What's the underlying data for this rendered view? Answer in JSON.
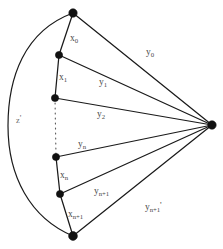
{
  "figure": {
    "name": "graph-diagram",
    "background_color": "#ffffff",
    "stroke_color": "#1a1a1a",
    "label_color": "#4a4a4a",
    "width": 223,
    "height": 249
  },
  "vertices": [
    {
      "id": "top",
      "name": "vertex-top",
      "cx": 73,
      "cy": 13,
      "r": 4.2
    },
    {
      "id": "v1",
      "name": "vertex-1",
      "cx": 59,
      "cy": 55,
      "r": 3.6
    },
    {
      "id": "v2",
      "name": "vertex-2",
      "cx": 55,
      "cy": 98,
      "r": 3.6
    },
    {
      "id": "v3",
      "name": "vertex-3",
      "cx": 56,
      "cy": 157,
      "r": 3.6
    },
    {
      "id": "v4",
      "name": "vertex-4",
      "cx": 60,
      "cy": 194,
      "r": 3.6
    },
    {
      "id": "bottom",
      "name": "vertex-bottom",
      "cx": 73,
      "cy": 236,
      "r": 4.4
    },
    {
      "id": "apex",
      "name": "vertex-apex-right",
      "cx": 212,
      "cy": 125,
      "r": 4.2
    }
  ],
  "chain_edges": [
    {
      "name": "chain-edge-x0",
      "label_key": "x0",
      "d": "M 73 13 L 59 55"
    },
    {
      "name": "chain-edge-x1",
      "label_key": "x1",
      "d": "M 59 55 L 55 98"
    },
    {
      "name": "chain-edge-xn",
      "label_key": "xn",
      "d": "M 56 157 L 60 194"
    },
    {
      "name": "chain-edge-xnp1",
      "label_key": "xnp1",
      "d": "M 60 194 L 73 236"
    }
  ],
  "chain_gap": {
    "name": "chain-ellipsis-dashed",
    "d": "M 55 98 L 56 157"
  },
  "spoke_edges": [
    {
      "name": "spoke-edge-y0",
      "label_key": "y0",
      "d": "M 73 13 L 212 125"
    },
    {
      "name": "spoke-edge-y1",
      "label_key": "y1",
      "d": "M 59 55 L 212 125"
    },
    {
      "name": "spoke-edge-y2",
      "label_key": "y2",
      "d": "M 55 98 L 212 125"
    },
    {
      "name": "spoke-edge-yn",
      "label_key": "yn",
      "d": "M 56 157 L 212 125"
    },
    {
      "name": "spoke-edge-ynp1",
      "label_key": "ynp1",
      "d": "M 60 194 L 212 125"
    },
    {
      "name": "spoke-edge-ynp1p",
      "label_key": "ynp1p",
      "d": "M 73 236 L 212 125"
    }
  ],
  "outer_arc": {
    "name": "outer-arc-z-prime",
    "d": "M 73 13 C 24 31, 8 78, 8 126 C 8 176, 30 218, 73 236"
  },
  "labels": {
    "x0": {
      "name": "label-x0",
      "base": "x",
      "sub": "0",
      "prime": "",
      "x": 70,
      "y": 34
    },
    "x1": {
      "name": "label-x1",
      "base": "x",
      "sub": "1",
      "prime": "",
      "x": 59,
      "y": 73
    },
    "xn": {
      "name": "label-xn",
      "base": "x",
      "sub": "n",
      "prime": "",
      "x": 60,
      "y": 171
    },
    "xnp1": {
      "name": "label-xn-plus-1",
      "base": "x",
      "sub": "n+1",
      "prime": "",
      "x": 68,
      "y": 210
    },
    "y0": {
      "name": "label-y0",
      "base": "y",
      "sub": "0",
      "prime": "",
      "x": 146,
      "y": 48
    },
    "y1": {
      "name": "label-y1",
      "base": "y",
      "sub": "1",
      "prime": "",
      "x": 99,
      "y": 78
    },
    "y2": {
      "name": "label-y2",
      "base": "y",
      "sub": "2",
      "prime": "",
      "x": 97,
      "y": 110
    },
    "yn": {
      "name": "label-yn",
      "base": "y",
      "sub": "n",
      "prime": "",
      "x": 78,
      "y": 140
    },
    "ynp1": {
      "name": "label-yn-plus-1",
      "base": "y",
      "sub": "n+1",
      "prime": "",
      "x": 94,
      "y": 187
    },
    "ynp1p": {
      "name": "label-yn-plus-1-prime",
      "base": "y",
      "sub": "n+1",
      "prime": "'",
      "x": 145,
      "y": 201
    },
    "z": {
      "name": "label-z-prime",
      "base": "z",
      "sub": "",
      "prime": "'",
      "x": 16,
      "y": 114
    }
  }
}
